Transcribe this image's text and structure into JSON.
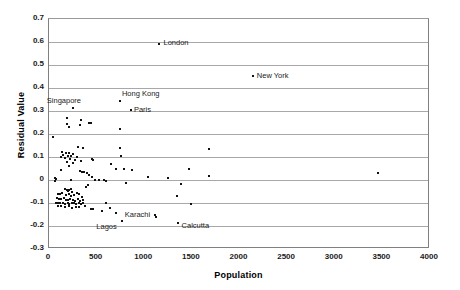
{
  "chart_data": {
    "type": "scatter",
    "title": "",
    "xlabel": "Population",
    "ylabel": "Residual Value",
    "xlim": [
      0,
      4000
    ],
    "ylim": [
      -0.3,
      0.7
    ],
    "xticks": [
      0,
      500,
      1000,
      1500,
      2000,
      2500,
      3000,
      3500,
      4000
    ],
    "xtick_labels": [
      "0",
      "500",
      "1000",
      "1500",
      "2000",
      "2500",
      "3000",
      "3500",
      "4000"
    ],
    "yticks": [
      -0.3,
      -0.2,
      -0.1,
      0,
      0.1,
      0.2,
      0.3,
      0.4,
      0.5,
      0.6,
      0.7
    ],
    "ytick_labels": [
      "-0.3",
      "-0.2",
      "-0.1",
      "0",
      "0.1",
      "0.2",
      "0.3",
      "0.4",
      "0.5",
      "0.6",
      "0.7"
    ],
    "grid": "horizontal",
    "legend": "none",
    "marker_color": "#111111",
    "gridline_color": "#a8a8a8",
    "annotations": [
      {
        "label": "London",
        "x": 1160,
        "y": 0.592
      },
      {
        "label": "New York",
        "x": 2140,
        "y": 0.452
      },
      {
        "label": "Hong Kong",
        "x": 745,
        "y": 0.345
      },
      {
        "label": "Singapore",
        "x": 250,
        "y": 0.315
      },
      {
        "label": "Paris",
        "x": 860,
        "y": 0.305
      },
      {
        "label": "Karachi",
        "x": 1110,
        "y": -0.152
      },
      {
        "label": "Lagos",
        "x": 770,
        "y": -0.178
      },
      {
        "label": "Calcutta",
        "x": 1350,
        "y": -0.188
      }
    ],
    "points": [
      {
        "x": 1160,
        "y": 0.592
      },
      {
        "x": 2140,
        "y": 0.452
      },
      {
        "x": 745,
        "y": 0.345
      },
      {
        "x": 250,
        "y": 0.315
      },
      {
        "x": 860,
        "y": 0.305
      },
      {
        "x": 185,
        "y": 0.268
      },
      {
        "x": 340,
        "y": 0.262
      },
      {
        "x": 185,
        "y": 0.243
      },
      {
        "x": 205,
        "y": 0.232
      },
      {
        "x": 330,
        "y": 0.238
      },
      {
        "x": 420,
        "y": 0.247
      },
      {
        "x": 445,
        "y": 0.248
      },
      {
        "x": 750,
        "y": 0.222
      },
      {
        "x": 40,
        "y": 0.185
      },
      {
        "x": 300,
        "y": 0.142
      },
      {
        "x": 355,
        "y": 0.138
      },
      {
        "x": 745,
        "y": 0.138
      },
      {
        "x": 1680,
        "y": 0.135
      },
      {
        "x": 140,
        "y": 0.122
      },
      {
        "x": 175,
        "y": 0.118
      },
      {
        "x": 215,
        "y": 0.116
      },
      {
        "x": 255,
        "y": 0.112
      },
      {
        "x": 150,
        "y": 0.108
      },
      {
        "x": 195,
        "y": 0.106
      },
      {
        "x": 235,
        "y": 0.104
      },
      {
        "x": 290,
        "y": 0.102
      },
      {
        "x": 760,
        "y": 0.105
      },
      {
        "x": 130,
        "y": 0.098
      },
      {
        "x": 165,
        "y": 0.096
      },
      {
        "x": 225,
        "y": 0.092
      },
      {
        "x": 275,
        "y": 0.088
      },
      {
        "x": 450,
        "y": 0.09
      },
      {
        "x": 465,
        "y": 0.088
      },
      {
        "x": 190,
        "y": 0.078
      },
      {
        "x": 255,
        "y": 0.072
      },
      {
        "x": 340,
        "y": 0.082
      },
      {
        "x": 655,
        "y": 0.07
      },
      {
        "x": 1470,
        "y": 0.05
      },
      {
        "x": 3450,
        "y": 0.032
      },
      {
        "x": 215,
        "y": 0.06
      },
      {
        "x": 130,
        "y": 0.042
      },
      {
        "x": 700,
        "y": 0.048
      },
      {
        "x": 790,
        "y": 0.046
      },
      {
        "x": 875,
        "y": 0.042
      },
      {
        "x": 330,
        "y": 0.038
      },
      {
        "x": 345,
        "y": 0.036
      },
      {
        "x": 370,
        "y": 0.036
      },
      {
        "x": 395,
        "y": 0.03
      },
      {
        "x": 1680,
        "y": 0.018
      },
      {
        "x": 1040,
        "y": 0.012
      },
      {
        "x": 1245,
        "y": 0.01
      },
      {
        "x": 420,
        "y": 0.02
      },
      {
        "x": 455,
        "y": 0.012
      },
      {
        "x": 60,
        "y": 0.01
      },
      {
        "x": 75,
        "y": 0.006
      },
      {
        "x": 60,
        "y": -0.004
      },
      {
        "x": 230,
        "y": 0.002
      },
      {
        "x": 480,
        "y": 0.0
      },
      {
        "x": 530,
        "y": -0.002
      },
      {
        "x": 575,
        "y": -0.002
      },
      {
        "x": 600,
        "y": -0.004
      },
      {
        "x": 805,
        "y": -0.012
      },
      {
        "x": 1385,
        "y": -0.018
      },
      {
        "x": 165,
        "y": -0.038
      },
      {
        "x": 185,
        "y": -0.042
      },
      {
        "x": 200,
        "y": -0.046
      },
      {
        "x": 215,
        "y": -0.044
      },
      {
        "x": 230,
        "y": -0.04
      },
      {
        "x": 240,
        "y": -0.052
      },
      {
        "x": 390,
        "y": -0.032
      },
      {
        "x": 405,
        "y": -0.022
      },
      {
        "x": 95,
        "y": -0.06
      },
      {
        "x": 115,
        "y": -0.062
      },
      {
        "x": 140,
        "y": -0.058
      },
      {
        "x": 175,
        "y": -0.066
      },
      {
        "x": 205,
        "y": -0.062
      },
      {
        "x": 235,
        "y": -0.068
      },
      {
        "x": 265,
        "y": -0.066
      },
      {
        "x": 290,
        "y": -0.058
      },
      {
        "x": 310,
        "y": -0.062
      },
      {
        "x": 345,
        "y": -0.072
      },
      {
        "x": 1340,
        "y": -0.068
      },
      {
        "x": 80,
        "y": -0.08
      },
      {
        "x": 105,
        "y": -0.082
      },
      {
        "x": 130,
        "y": -0.084
      },
      {
        "x": 155,
        "y": -0.078
      },
      {
        "x": 180,
        "y": -0.086
      },
      {
        "x": 200,
        "y": -0.088
      },
      {
        "x": 220,
        "y": -0.082
      },
      {
        "x": 250,
        "y": -0.086
      },
      {
        "x": 275,
        "y": -0.09
      },
      {
        "x": 300,
        "y": -0.084
      },
      {
        "x": 325,
        "y": -0.092
      },
      {
        "x": 355,
        "y": -0.086
      },
      {
        "x": 70,
        "y": -0.098
      },
      {
        "x": 95,
        "y": -0.1
      },
      {
        "x": 120,
        "y": -0.102
      },
      {
        "x": 145,
        "y": -0.098
      },
      {
        "x": 170,
        "y": -0.104
      },
      {
        "x": 195,
        "y": -0.1
      },
      {
        "x": 215,
        "y": -0.106
      },
      {
        "x": 240,
        "y": -0.102
      },
      {
        "x": 260,
        "y": -0.1
      },
      {
        "x": 285,
        "y": -0.104
      },
      {
        "x": 310,
        "y": -0.098
      },
      {
        "x": 335,
        "y": -0.106
      },
      {
        "x": 360,
        "y": -0.1
      },
      {
        "x": 600,
        "y": -0.102
      },
      {
        "x": 1490,
        "y": -0.105
      },
      {
        "x": 90,
        "y": -0.112
      },
      {
        "x": 130,
        "y": -0.115
      },
      {
        "x": 165,
        "y": -0.118
      },
      {
        "x": 205,
        "y": -0.112
      },
      {
        "x": 245,
        "y": -0.12
      },
      {
        "x": 280,
        "y": -0.116
      },
      {
        "x": 320,
        "y": -0.118
      },
      {
        "x": 380,
        "y": -0.112
      },
      {
        "x": 440,
        "y": -0.125
      },
      {
        "x": 465,
        "y": -0.128
      },
      {
        "x": 640,
        "y": -0.122
      },
      {
        "x": 555,
        "y": -0.135
      },
      {
        "x": 700,
        "y": -0.142
      },
      {
        "x": 1110,
        "y": -0.152
      },
      {
        "x": 1125,
        "y": -0.162
      },
      {
        "x": 770,
        "y": -0.178
      },
      {
        "x": 1350,
        "y": -0.188
      }
    ]
  }
}
